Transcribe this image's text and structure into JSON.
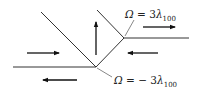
{
  "diagram": {
    "type": "domain-wall-junction",
    "labels": {
      "top": {
        "lhs": "Ω",
        "eq": " = 3",
        "var": "λ",
        "sub": "100"
      },
      "bottom": {
        "lhs": "Ω",
        "eq": " = − 3",
        "var": "λ",
        "sub": "100"
      }
    },
    "arrows": [
      {
        "id": "left-middle",
        "direction": "right"
      },
      {
        "id": "bottom-left",
        "direction": "left"
      },
      {
        "id": "center",
        "direction": "up"
      },
      {
        "id": "right-top",
        "direction": "right"
      },
      {
        "id": "right-middle",
        "direction": "left"
      }
    ],
    "colors": {
      "line": "#333333",
      "arrow": "#111111",
      "text": "#222222"
    }
  }
}
